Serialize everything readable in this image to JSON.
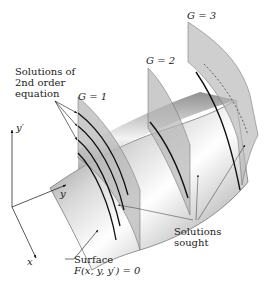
{
  "figure": {
    "plane_labels": [
      {
        "id": "g1",
        "text": "G = 1"
      },
      {
        "id": "g2",
        "text": "G = 2"
      },
      {
        "id": "g3",
        "text": "G = 3"
      }
    ],
    "annotations": {
      "solutions_2nd_order": [
        "Solutions of",
        "2nd order",
        "equation"
      ],
      "solutions_sought": [
        "Solutions",
        "sought"
      ],
      "surface": [
        "Surface",
        "F(x, y, y′) = 0"
      ]
    },
    "axes": {
      "x": "x",
      "y": "y",
      "yprime": "y′"
    },
    "colors": {
      "surface_light": "#f4f4f4",
      "surface_dark": "#7a7a7a",
      "plane": "#b9b9b9",
      "curve": "#1a1a1a"
    }
  }
}
